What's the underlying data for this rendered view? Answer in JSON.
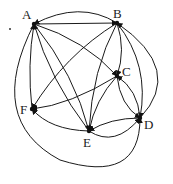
{
  "diagram": {
    "type": "directed-graph",
    "nodes": [
      {
        "id": "A",
        "label": "A",
        "x": 34,
        "y": 24,
        "lx": 22,
        "ly": 19
      },
      {
        "id": "B",
        "label": "B",
        "x": 117,
        "y": 23,
        "lx": 113,
        "ly": 18
      },
      {
        "id": "C",
        "label": "C",
        "x": 117,
        "y": 76,
        "lx": 122,
        "ly": 76
      },
      {
        "id": "D",
        "label": "D",
        "x": 140,
        "y": 118,
        "lx": 144,
        "ly": 129
      },
      {
        "id": "E",
        "label": "E",
        "x": 89,
        "y": 131,
        "lx": 83,
        "ly": 147
      },
      {
        "id": "F",
        "label": "F",
        "x": 32,
        "y": 109,
        "lx": 20,
        "ly": 114
      }
    ],
    "edges": [
      {
        "from": "B",
        "to": "A",
        "path": "M117,23 Q80,0 34,24"
      },
      {
        "from": "A",
        "to": "B",
        "path": "M34,24 L117,23"
      },
      {
        "from": "A",
        "to": "C",
        "path": "M34,24 Q85,40 117,76"
      },
      {
        "from": "A",
        "to": "E",
        "path": "M34,24 Q75,75 89,131"
      },
      {
        "from": "E",
        "to": "A",
        "path": "M89,131 Q50,80 34,24"
      },
      {
        "from": "F",
        "to": "A",
        "path": "M32,109 Q27,65 34,24"
      },
      {
        "from": "B",
        "to": "F",
        "path": "M117,23 Q65,55 32,109"
      },
      {
        "from": "B",
        "to": "C",
        "path": "M117,23 Q126,50 117,76"
      },
      {
        "from": "B",
        "to": "E",
        "path": "M117,23 Q92,70 89,131"
      },
      {
        "from": "B",
        "to": "D",
        "path": "M117,23 Q150,65 140,118"
      },
      {
        "from": "D",
        "to": "B",
        "path": "M140,118 Q185,70 117,23"
      },
      {
        "from": "C",
        "to": "F",
        "path": "M117,76 Q70,105 32,109"
      },
      {
        "from": "C",
        "to": "E",
        "path": "M117,76 Q95,100 89,131"
      },
      {
        "from": "C",
        "to": "D",
        "path": "M117,76 Q120,105 140,118"
      },
      {
        "from": "D",
        "to": "C",
        "path": "M140,118 Q138,90 117,76"
      },
      {
        "from": "E",
        "to": "F",
        "path": "M89,131 Q50,130 32,109"
      },
      {
        "from": "E",
        "to": "D",
        "path": "M89,131 Q115,148 140,118"
      },
      {
        "from": "D",
        "to": "E",
        "path": "M140,118 Q110,118 89,131"
      },
      {
        "from": "A",
        "to": "D",
        "path": "M34,24 Q-15,120 60,160 Q140,185 140,118"
      }
    ]
  }
}
